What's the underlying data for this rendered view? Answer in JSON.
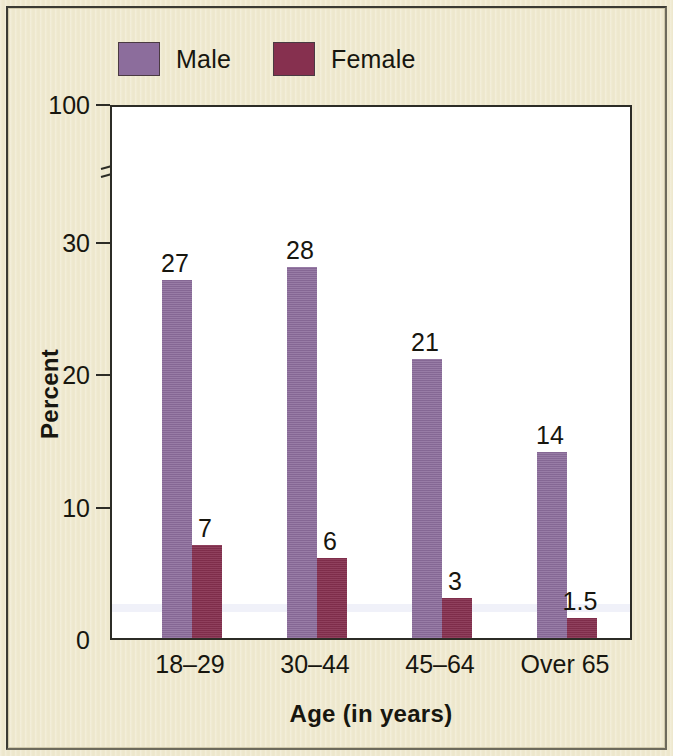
{
  "colors": {
    "background": "#efe9cf",
    "plot_background": "#ffffff",
    "axis": "#2c2c26",
    "male": "#8c6d9c",
    "female": "#86304f",
    "text": "#17160f"
  },
  "legend": {
    "position": "top-left",
    "entries": [
      {
        "label": "Male",
        "color": "#8c6d9c"
      },
      {
        "label": "Female",
        "color": "#86304f"
      }
    ]
  },
  "axes": {
    "y_title": "Percent",
    "x_title": "Age (in years)",
    "y_ticks": [
      "0",
      "10",
      "20",
      "30",
      "100"
    ],
    "y_break_between": [
      "30",
      "100"
    ],
    "x_ticks": [
      "18–29",
      "30–44",
      "45–64",
      "Over 65"
    ]
  },
  "chart_data": {
    "type": "bar",
    "title": "",
    "subtitle": "",
    "xlabel": "Age (in years)",
    "ylabel": "Percent",
    "categories": [
      "18–29",
      "30–44",
      "45–64",
      "Over 65"
    ],
    "series": [
      {
        "name": "Male",
        "color": "#8c6d9c",
        "values": [
          27,
          28,
          21,
          14
        ],
        "labels": [
          "27",
          "28",
          "21",
          "14"
        ]
      },
      {
        "name": "Female",
        "color": "#86304f",
        "values": [
          7,
          6,
          3,
          1.5
        ],
        "labels": [
          "7",
          "6",
          "3",
          "1.5"
        ]
      }
    ],
    "ylim": [
      0,
      30
    ],
    "y_axis_broken": true,
    "y_axis_top_label": "100",
    "y_tick_values": [
      0,
      10,
      20,
      30
    ],
    "grid": false,
    "legend_position": "top-left",
    "bar_labels_shown": true,
    "bars_adjacent": true
  }
}
